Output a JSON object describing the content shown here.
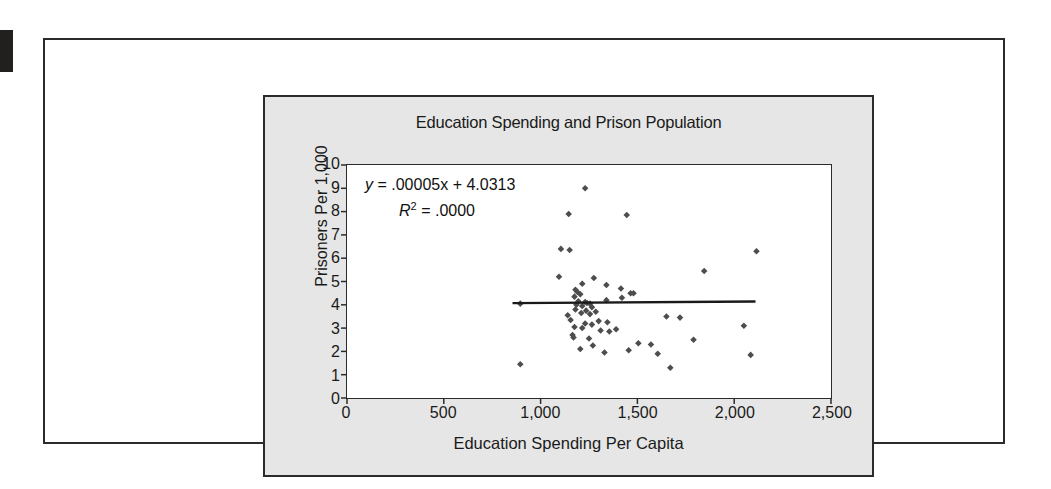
{
  "figure": {
    "title": "Education Spending and Prison Population",
    "x_axis_title": "Education Spending Per Capita",
    "y_axis_title": "Prisoners Per 1,000",
    "equation_y": "y",
    "equation_body": "= .00005x + 4.0313",
    "r_squared_symbol": "R",
    "r_squared_exponent": "2",
    "r_squared_body": "= .0000",
    "colors": {
      "panel": "#e6e6e6",
      "plot_background": "#ffffff",
      "marker": "#4d4d4d",
      "trendline": "#1a1a1a",
      "axis": "#2b2b2b",
      "text": "#1a1a1a"
    }
  },
  "chart_data": {
    "type": "scatter",
    "title": "Education Spending and Prison Population",
    "xlabel": "Education Spending Per Capita",
    "ylabel": "Prisoners Per 1,000",
    "xlim": [
      0,
      2500
    ],
    "ylim": [
      0,
      10
    ],
    "xticks": [
      0,
      500,
      1000,
      1500,
      2000,
      2500
    ],
    "xtick_labels": [
      "0",
      "500",
      "1,000",
      "1,500",
      "2,000",
      "2,500"
    ],
    "yticks": [
      0,
      1,
      2,
      3,
      4,
      5,
      6,
      7,
      8,
      9,
      10
    ],
    "ytick_labels": [
      "0",
      "1",
      "2",
      "3",
      "4",
      "5",
      "6",
      "7",
      "8",
      "9",
      "10"
    ],
    "grid": false,
    "legend": false,
    "annotations": [
      {
        "text": "y = .00005x + 4.0313",
        "x": 1000,
        "y": 9.0
      },
      {
        "text": "R2 = .0000",
        "x": 1150,
        "y": 8.0
      }
    ],
    "trendline": {
      "label": "linear fit",
      "slope": 5e-05,
      "intercept": 4.0313,
      "r_squared": 0.0,
      "x_start": 855,
      "x_end": 2110,
      "y_start": 4.07,
      "y_end": 4.14
    },
    "points": [
      [
        1230,
        9.0
      ],
      [
        1145,
        7.9
      ],
      [
        1445,
        7.85
      ],
      [
        1105,
        6.4
      ],
      [
        1150,
        6.35
      ],
      [
        2115,
        6.3
      ],
      [
        1845,
        5.45
      ],
      [
        1095,
        5.2
      ],
      [
        1275,
        5.15
      ],
      [
        1215,
        4.9
      ],
      [
        1340,
        4.85
      ],
      [
        1415,
        4.7
      ],
      [
        1180,
        4.65
      ],
      [
        1190,
        4.55
      ],
      [
        1465,
        4.5
      ],
      [
        1480,
        4.5
      ],
      [
        1205,
        4.45
      ],
      [
        1175,
        4.35
      ],
      [
        1420,
        4.3
      ],
      [
        1340,
        4.2
      ],
      [
        1195,
        4.15
      ],
      [
        1230,
        4.12
      ],
      [
        1240,
        4.08
      ],
      [
        1255,
        4.05
      ],
      [
        895,
        4.05
      ],
      [
        1185,
        4.0
      ],
      [
        1215,
        3.95
      ],
      [
        1265,
        3.9
      ],
      [
        1180,
        3.8
      ],
      [
        1235,
        3.75
      ],
      [
        1285,
        3.7
      ],
      [
        1210,
        3.65
      ],
      [
        1255,
        3.6
      ],
      [
        1140,
        3.55
      ],
      [
        1650,
        3.5
      ],
      [
        1720,
        3.45
      ],
      [
        1155,
        3.35
      ],
      [
        1300,
        3.3
      ],
      [
        1345,
        3.25
      ],
      [
        1230,
        3.2
      ],
      [
        1265,
        3.15
      ],
      [
        2050,
        3.1
      ],
      [
        1175,
        3.05
      ],
      [
        1215,
        3.0
      ],
      [
        1390,
        2.95
      ],
      [
        1310,
        2.9
      ],
      [
        1355,
        2.85
      ],
      [
        1165,
        2.7
      ],
      [
        1170,
        2.6
      ],
      [
        1250,
        2.55
      ],
      [
        1790,
        2.5
      ],
      [
        1505,
        2.35
      ],
      [
        1570,
        2.3
      ],
      [
        1270,
        2.25
      ],
      [
        1205,
        2.1
      ],
      [
        1455,
        2.05
      ],
      [
        1330,
        1.95
      ],
      [
        1605,
        1.9
      ],
      [
        2085,
        1.85
      ],
      [
        895,
        1.45
      ],
      [
        1670,
        1.3
      ]
    ]
  }
}
